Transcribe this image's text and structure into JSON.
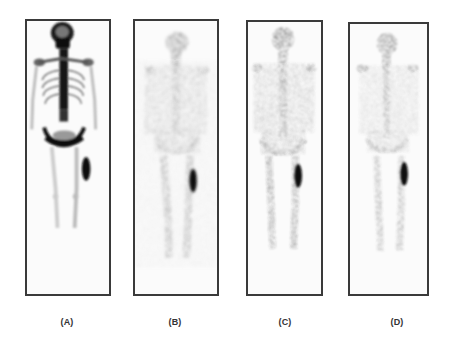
{
  "figure": {
    "panels": [
      {
        "id": "A",
        "label": "(A)",
        "box": {
          "x": 25,
          "y": 19,
          "w": 86,
          "h": 277
        },
        "style": "sharp",
        "noise": 0.05
      },
      {
        "id": "B",
        "label": "(B)",
        "box": {
          "x": 133,
          "y": 19,
          "w": 86,
          "h": 277
        },
        "style": "noisy",
        "noise": 0.55
      },
      {
        "id": "C",
        "label": "(C)",
        "box": {
          "x": 246,
          "y": 20,
          "w": 77,
          "h": 276
        },
        "style": "noisy",
        "noise": 0.45
      },
      {
        "id": "D",
        "label": "(D)",
        "box": {
          "x": 348,
          "y": 22,
          "w": 81,
          "h": 274
        },
        "style": "noisy",
        "noise": 0.35
      }
    ],
    "label_centers": [
      67,
      175,
      285,
      397
    ],
    "colors": {
      "border": "#3a3a3a",
      "background": "#ffffff",
      "uptake_dark": "#111111",
      "label_text": "#333333"
    }
  }
}
